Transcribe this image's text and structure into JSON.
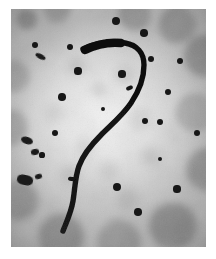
{
  "image": {
    "kind": "electron-micrograph",
    "subject": "curved filamentous structure",
    "border_color": "#ffffff",
    "background_light": "#f2f2f2",
    "background_mid": "#c9c9c9",
    "background_dark": "#6a6a6a",
    "particle_color": "#171717",
    "filament_color": "#121212",
    "plate": {
      "x": 11,
      "y": 9,
      "width": 195,
      "height": 238
    },
    "caption": ""
  },
  "filament": {
    "name": "s-curved-filament",
    "stroke_color": "#121212",
    "head_width": 9,
    "tail_width": 4,
    "path": "M 72 40 C 84 34, 100 32, 114 34 C 126 36, 133 44, 133 56 C 133 70, 128 82, 120 94 C 112 106, 100 116, 90 126 C 80 136, 72 146, 68 157 C 64 168, 64 180, 62 192 C 60 204, 55 214, 52 222",
    "spurs": [
      {
        "name": "upper-spur",
        "x": 115,
        "y": 77,
        "w": 7,
        "h": 4,
        "rot": -20
      },
      {
        "name": "lower-spur",
        "x": 57,
        "y": 168,
        "w": 8,
        "h": 4,
        "rot": 8
      }
    ]
  },
  "particles": [
    {
      "cx": 105,
      "cy": 12,
      "r": 4.2
    },
    {
      "cx": 24,
      "cy": 36,
      "r": 3.2
    },
    {
      "cx": 59,
      "cy": 38,
      "r": 3.4
    },
    {
      "cx": 133,
      "cy": 24,
      "r": 3.8
    },
    {
      "cx": 140,
      "cy": 50,
      "r": 3.4
    },
    {
      "cx": 169,
      "cy": 52,
      "r": 3.2
    },
    {
      "cx": 67,
      "cy": 62,
      "r": 3.6
    },
    {
      "cx": 111,
      "cy": 65,
      "r": 3.6
    },
    {
      "cx": 157,
      "cy": 83,
      "r": 3.4
    },
    {
      "cx": 51,
      "cy": 88,
      "r": 3.8
    },
    {
      "cx": 134,
      "cy": 112,
      "r": 3.4
    },
    {
      "cx": 149,
      "cy": 113,
      "r": 3.2
    },
    {
      "cx": 186,
      "cy": 124,
      "r": 3.0
    },
    {
      "cx": 44,
      "cy": 124,
      "r": 3.0
    },
    {
      "cx": 106,
      "cy": 178,
      "r": 4.0
    },
    {
      "cx": 166,
      "cy": 180,
      "r": 3.6
    },
    {
      "cx": 127,
      "cy": 203,
      "r": 3.8
    },
    {
      "cx": 149,
      "cy": 150,
      "r": 2.4
    },
    {
      "cx": 92,
      "cy": 100,
      "r": 2.2
    },
    {
      "cx": 31,
      "cy": 146,
      "r": 2.6
    }
  ],
  "blobs": [
    {
      "name": "elongated-blob-upper-left",
      "x": 24,
      "y": 45,
      "w": 11,
      "h": 5,
      "rot": 28,
      "radius": "50%"
    },
    {
      "name": "irregular-blob-left",
      "x": 10,
      "y": 128,
      "w": 12,
      "h": 7,
      "rot": 18,
      "radius": "45%"
    },
    {
      "name": "irregular-blob-left-lower",
      "x": 20,
      "y": 140,
      "w": 8,
      "h": 6,
      "rot": -10,
      "radius": "45%"
    },
    {
      "name": "cluster-blob-left",
      "x": 6,
      "y": 166,
      "w": 16,
      "h": 10,
      "rot": 12,
      "radius": "40%"
    },
    {
      "name": "small-blob-left",
      "x": 24,
      "y": 165,
      "w": 7,
      "h": 5,
      "rot": -15,
      "radius": "45%"
    }
  ]
}
